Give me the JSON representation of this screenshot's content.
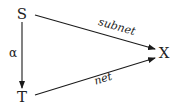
{
  "diagram": {
    "type": "commutative-diagram",
    "nodes": [
      {
        "id": "S",
        "label": "S"
      },
      {
        "id": "T",
        "label": "T"
      },
      {
        "id": "X",
        "label": "X"
      }
    ],
    "edges": [
      {
        "from": "S",
        "to": "T",
        "label": "α"
      },
      {
        "from": "S",
        "to": "X",
        "label": "subnet"
      },
      {
        "from": "T",
        "to": "X",
        "label": "net"
      }
    ]
  }
}
